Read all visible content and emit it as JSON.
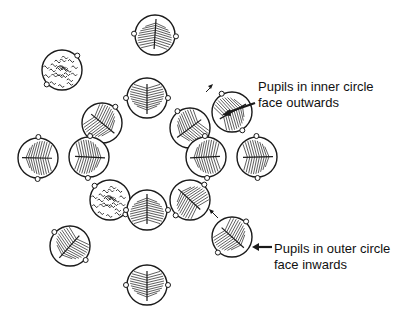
{
  "diagram": {
    "colors": {
      "ink": "#1a1a1a",
      "background": "#ffffff"
    },
    "annotations": [
      {
        "id": "inner",
        "lines": [
          "Pupils in inner circle",
          "face outwards"
        ],
        "x": 258,
        "y": 79
      },
      {
        "id": "outer",
        "lines": [
          "Pupils in outer circle",
          "face inwards"
        ],
        "x": 274,
        "y": 241
      }
    ],
    "outer_circle": [
      {
        "x": 155,
        "y": 35,
        "style": "hair",
        "facing": "in"
      },
      {
        "x": 62,
        "y": 70,
        "style": "curly",
        "facing": "in"
      },
      {
        "x": 232,
        "y": 112,
        "style": "hair",
        "facing": "in"
      },
      {
        "x": 38,
        "y": 158,
        "style": "hair",
        "facing": "in"
      },
      {
        "x": 257,
        "y": 157,
        "style": "hair",
        "facing": "in"
      },
      {
        "x": 110,
        "y": 200,
        "style": "curly",
        "facing": "in"
      },
      {
        "x": 232,
        "y": 237,
        "style": "hair",
        "facing": "in"
      },
      {
        "x": 70,
        "y": 246,
        "style": "hair",
        "facing": "in"
      },
      {
        "x": 147,
        "y": 285,
        "style": "hair",
        "facing": "in"
      }
    ],
    "inner_circle": [
      {
        "x": 147,
        "y": 98,
        "style": "hair",
        "facing": "out"
      },
      {
        "x": 102,
        "y": 123,
        "style": "hair",
        "facing": "out"
      },
      {
        "x": 190,
        "y": 128,
        "style": "hair",
        "facing": "out"
      },
      {
        "x": 89,
        "y": 157,
        "style": "hair",
        "facing": "out"
      },
      {
        "x": 206,
        "y": 157,
        "style": "hair",
        "facing": "out"
      },
      {
        "x": 190,
        "y": 200,
        "style": "hair",
        "facing": "out"
      },
      {
        "x": 147,
        "y": 210,
        "style": "hair",
        "facing": "out"
      }
    ]
  }
}
